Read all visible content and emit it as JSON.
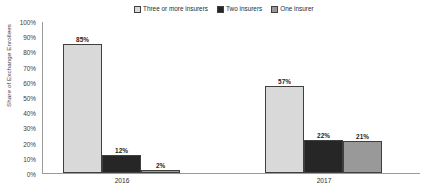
{
  "chart_data": {
    "type": "bar",
    "title": "",
    "xlabel": "",
    "ylabel": "Share of Exchange Enrollees",
    "categories": [
      "2016",
      "2017"
    ],
    "ylim": [
      0,
      100
    ],
    "ytick_labels": [
      "100%",
      "90%",
      "80%",
      "70%",
      "60%",
      "50%",
      "40%",
      "30%",
      "20%",
      "10%",
      "0%"
    ],
    "ytick_values": [
      100,
      90,
      80,
      70,
      60,
      50,
      40,
      30,
      20,
      10,
      0
    ],
    "grid": false,
    "legend_position": "top-center",
    "series": [
      {
        "name": "Three or more insurers",
        "color": "#d9d9d9",
        "values": [
          85,
          57
        ],
        "labels": [
          "85%",
          "57%"
        ]
      },
      {
        "name": "Two insurers",
        "color": "#262626",
        "values": [
          12,
          22
        ],
        "labels": [
          "12%",
          "22%"
        ]
      },
      {
        "name": "One insurer",
        "color": "#999999",
        "values": [
          2,
          21
        ],
        "labels": [
          "2%",
          "21%"
        ]
      }
    ]
  },
  "legend": {
    "items": [
      {
        "label": "Three or more insurers",
        "color": "#d9d9d9"
      },
      {
        "label": "Two insurers",
        "color": "#262626"
      },
      {
        "label": "One insurer",
        "color": "#999999"
      }
    ]
  },
  "axes": {
    "y_title": "Share of Exchange Enrollees",
    "y_ticks": [
      "100%",
      "90%",
      "80%",
      "70%",
      "60%",
      "50%",
      "40%",
      "30%",
      "20%",
      "10%",
      "0%"
    ],
    "x_ticks": [
      "2016",
      "2017"
    ]
  }
}
